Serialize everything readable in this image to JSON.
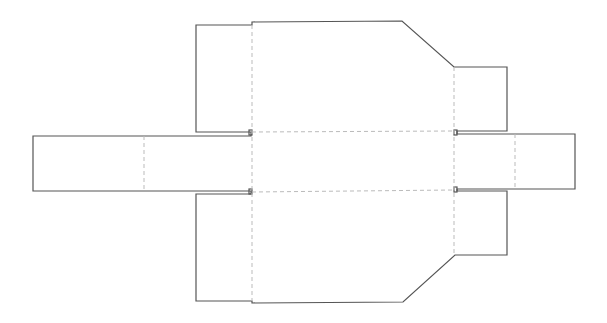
{
  "diagram": {
    "type": "box-dieline",
    "colors": {
      "cut_line": "#555555",
      "fold_line": "#bbbbbb",
      "background": "#ffffff"
    },
    "line_styles": {
      "cut": "solid",
      "fold": "dashed"
    },
    "panels": [
      {
        "id": "main-panel",
        "label": ""
      },
      {
        "id": "left-arm",
        "label": ""
      },
      {
        "id": "right-arm",
        "label": ""
      },
      {
        "id": "upper-left-flap",
        "label": ""
      },
      {
        "id": "lower-left-flap",
        "label": ""
      },
      {
        "id": "upper-right-flap",
        "label": ""
      },
      {
        "id": "lower-right-flap",
        "label": ""
      }
    ]
  }
}
